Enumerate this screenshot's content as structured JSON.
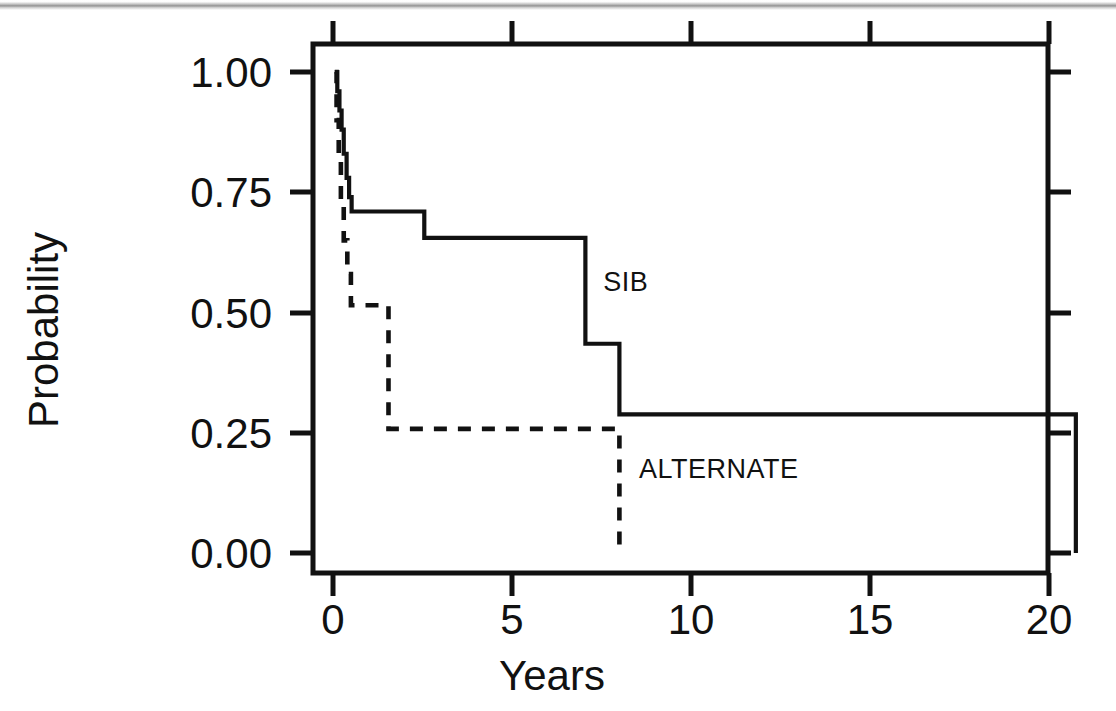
{
  "figure": {
    "background_color": "#ffffff",
    "ink_color": "#111111",
    "scan_artifact_top_band": true
  },
  "chart_data": {
    "type": "line",
    "subtype": "kaplan-meier-step",
    "title": "",
    "subtitle": "",
    "xlabel": "Years",
    "ylabel": "Probability",
    "xlim": [
      -0.55,
      21.85
    ],
    "ylim": [
      -0.045,
      1.075
    ],
    "xticks": [
      0,
      5,
      10,
      15,
      20
    ],
    "xtick_labels": [
      "0",
      "5",
      "10",
      "15",
      "20"
    ],
    "yticks": [
      0.0,
      0.25,
      0.5,
      0.75,
      1.0
    ],
    "ytick_labels": [
      "0.00",
      "0.25",
      "0.50",
      "0.75",
      "1.00"
    ],
    "grid": false,
    "frame": "box",
    "tick_direction": "out",
    "legend": "inline-annotations",
    "series": [
      {
        "name": "SIB",
        "style": "solid",
        "label_x": 7.55,
        "label_y": 0.545,
        "steps_x": [
          0.05,
          0.12,
          0.18,
          0.24,
          0.3,
          0.38,
          0.45,
          0.52,
          2.55,
          7.05,
          8.0,
          20.75,
          20.75
        ],
        "steps_y": [
          1.0,
          0.96,
          0.92,
          0.88,
          0.83,
          0.78,
          0.74,
          0.71,
          0.655,
          0.435,
          0.288,
          0.288,
          0.0
        ]
      },
      {
        "name": "ALTERNATE",
        "style": "dashed",
        "label_x": 8.55,
        "label_y": 0.155,
        "steps_x": [
          0.05,
          0.1,
          0.16,
          0.22,
          0.3,
          0.4,
          0.5,
          1.55,
          8.0,
          8.0
        ],
        "steps_y": [
          1.0,
          0.9,
          0.82,
          0.73,
          0.65,
          0.58,
          0.515,
          0.258,
          0.258,
          0.0
        ]
      }
    ]
  },
  "labels": {
    "y_axis_title": "Probability",
    "x_axis_title": "Years",
    "series_sib": "SIB",
    "series_alternate": "ALTERNATE",
    "ytick_100": "1.00",
    "ytick_075": "0.75",
    "ytick_050": "0.50",
    "ytick_025": "0.25",
    "ytick_000": "0.00",
    "xtick_0": "0",
    "xtick_5": "5",
    "xtick_10": "10",
    "xtick_15": "15",
    "xtick_20": "20"
  }
}
